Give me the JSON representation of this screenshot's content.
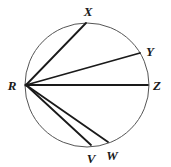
{
  "figure": {
    "type": "circle-geometry-diagram",
    "background_color": "#ffffff",
    "circle": {
      "name": "circle-outline",
      "center_x": 87,
      "center_y": 85,
      "radius": 62,
      "stroke_color": "#555555",
      "stroke_width": 1
    },
    "chord_color": "#1a1a1a",
    "chord_width": 1.8,
    "vertex": {
      "id": "R",
      "label": "R",
      "x": 26,
      "y": 85,
      "label_x": 12,
      "label_y": 85
    },
    "points": [
      {
        "id": "X",
        "label": "X",
        "x": 86,
        "y": 23,
        "label_x": 88,
        "label_y": 11
      },
      {
        "id": "Y",
        "label": "Y",
        "x": 140,
        "y": 53,
        "label_x": 150,
        "label_y": 51
      },
      {
        "id": "Z",
        "label": "Z",
        "x": 148,
        "y": 85,
        "label_x": 157,
        "label_y": 85
      },
      {
        "id": "W",
        "label": "W",
        "x": 108,
        "y": 142,
        "label_x": 112,
        "label_y": 155
      },
      {
        "id": "V",
        "label": "V",
        "x": 91,
        "y": 145,
        "label_x": 91,
        "label_y": 158
      }
    ],
    "chords": [
      {
        "name": "chord-r-x",
        "from": "R",
        "to": "X"
      },
      {
        "name": "chord-r-y",
        "from": "R",
        "to": "Y"
      },
      {
        "name": "chord-r-z",
        "from": "R",
        "to": "Z"
      },
      {
        "name": "chord-r-w",
        "from": "R",
        "to": "W"
      },
      {
        "name": "chord-r-v",
        "from": "R",
        "to": "V"
      }
    ]
  }
}
